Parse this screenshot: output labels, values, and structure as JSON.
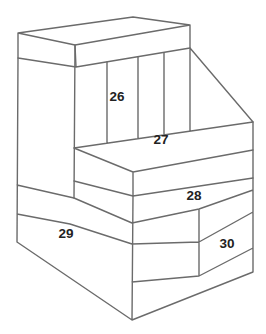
{
  "figure": {
    "background_color": "#ffffff",
    "line_color": "#6b6b6b",
    "label_color": "#222222",
    "labels": [
      {
        "id": "label-26",
        "text": "26",
        "location": "upper wall brick front face",
        "x": 117,
        "y": 101
      },
      {
        "id": "label-27",
        "text": "27",
        "location": "middle step top face",
        "x": 161,
        "y": 144
      },
      {
        "id": "label-28",
        "text": "28",
        "location": "middle step front face",
        "x": 194,
        "y": 200
      },
      {
        "id": "label-29",
        "text": "29",
        "location": "base front-left face",
        "x": 66,
        "y": 238
      },
      {
        "id": "label-30",
        "text": "30",
        "location": "base front-right face",
        "x": 227,
        "y": 248
      }
    ]
  }
}
